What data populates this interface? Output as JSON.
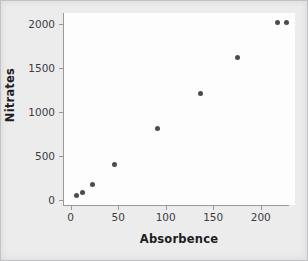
{
  "chart_data": {
    "type": "scatter",
    "title": "",
    "xlabel": "Absorbence",
    "ylabel": "Nitrates",
    "xlim": [
      -8,
      236
    ],
    "ylim": [
      -60,
      2120
    ],
    "xticks": [
      0,
      50,
      100,
      150,
      200
    ],
    "yticks": [
      0,
      500,
      1000,
      1500,
      2000
    ],
    "xtick_labels": [
      "0",
      "50",
      "100",
      "150",
      "200"
    ],
    "ytick_labels": [
      "0",
      "500",
      "1000",
      "1500",
      "2000"
    ],
    "grid": false,
    "legend": null,
    "marker_color": "#4b4b50",
    "plot_background": "#fdfdfd",
    "figure_background": "#ececed",
    "axis_color": "#9a9a9c",
    "points": [
      {
        "x": 6,
        "y": 45
      },
      {
        "x": 12,
        "y": 80
      },
      {
        "x": 23,
        "y": 170
      },
      {
        "x": 46,
        "y": 400
      },
      {
        "x": 91,
        "y": 805
      },
      {
        "x": 137,
        "y": 1210
      },
      {
        "x": 176,
        "y": 1610
      },
      {
        "x": 218,
        "y": 2010
      },
      {
        "x": 227,
        "y": 2010
      }
    ]
  }
}
